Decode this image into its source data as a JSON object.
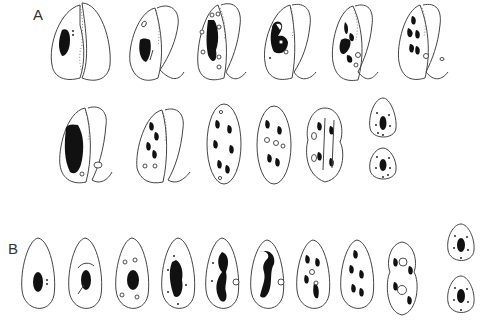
{
  "figure": {
    "panel_a": {
      "label": "A",
      "rows": [
        {
          "stages": [
            "conjugant pair stage 1",
            "conjugant pair stage 2",
            "conjugant pair stage 3",
            "conjugant pair stage 4",
            "conjugant pair stage 5",
            "conjugant pair stage 6"
          ]
        },
        {
          "stages": [
            "conjugant pair stage 7",
            "conjugant pair stage 8",
            "single cell stage 9",
            "single cell stage 10",
            "dividing cell stage 11",
            "daughter cells stage 12"
          ]
        }
      ]
    },
    "panel_b": {
      "label": "B",
      "stages": [
        "stage 1",
        "stage 2",
        "stage 3",
        "stage 4",
        "stage 5",
        "stage 6",
        "stage 7",
        "stage 8",
        "dividing stage 9",
        "daughter cells stage 10"
      ]
    },
    "colors": {
      "outline": "#444444",
      "nucleus": "#111111",
      "background": "#ffffff"
    }
  }
}
